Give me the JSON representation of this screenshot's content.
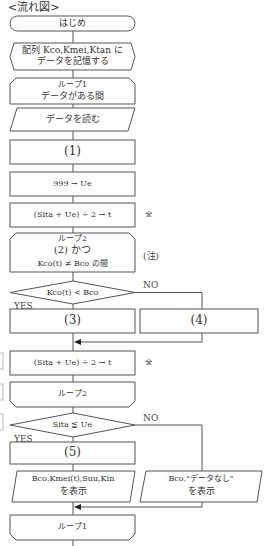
{
  "title": "<流れ図>",
  "nodes": {
    "start": "はじめ",
    "store_line1": "配列 Kco,Kmei,Ktan に",
    "store_line2": "データを記憶する",
    "loop1_start_line1": "ループ1",
    "loop1_start_line2": "データがある間",
    "read": "データを読む",
    "blank1": "(1)",
    "init_ue": "999 → Ue",
    "calc_t1": "(Sita + Ue) ÷ 2 → t",
    "loop2_start_line1": "ループ2",
    "loop2_start_line2": "(2) かつ",
    "loop2_start_line3": "Kco(t) ≠ Bco の間",
    "cond1": "Kco(t) < Bco",
    "blank3": "(3)",
    "blank4": "(4)",
    "calc_t2": "(Sita + Ue) ÷ 2 → t",
    "loop2_end": "ループ2",
    "cond2": "Sita ≦ Ue",
    "blank5": "(5)",
    "out_found_line1": "Bco,Kmei(t),Suu,Kin",
    "out_found_line2": "を表示",
    "out_none_line1": "Bco,\"データなし\"",
    "out_none_line2": "を表示",
    "loop1_end": "ループ1"
  },
  "labels": {
    "yes": "YES",
    "no": "NO",
    "asterisk": "※",
    "note": "(注)"
  },
  "colors": {
    "line": "#555555",
    "text": "#333333",
    "background": "#ffffff"
  }
}
